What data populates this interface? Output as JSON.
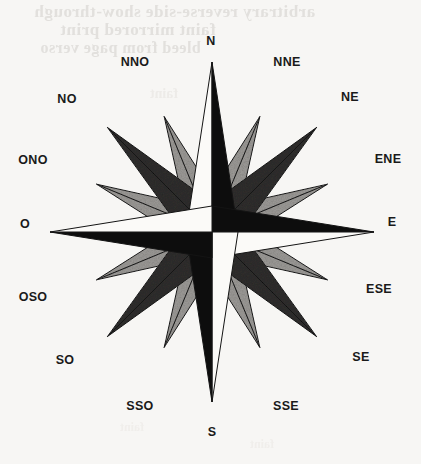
{
  "image": {
    "kind": "compass-rose-drawing",
    "medium": "pencil and ink on paper",
    "background_color": "#f7f6f4",
    "width": 421,
    "height": 464
  },
  "bleed_through_text": {
    "line1": "arbitrary reverse-side show-through",
    "line2": "faint mirrored print",
    "line3": "bleed from page verso",
    "line4": "faint",
    "line5": "faint",
    "line6": "faint",
    "line7": "faint"
  },
  "compass": {
    "center": {
      "x": 212,
      "y": 232
    },
    "colors": {
      "dark": "#0d0d0d",
      "light": "#fbfaf8",
      "charcoal": "#2f2e2d",
      "gray": "#9d9b98",
      "outline": "#141414"
    },
    "labels": [
      {
        "name": "N",
        "text": "N",
        "x": 211,
        "y": 41,
        "bearing": 0
      },
      {
        "name": "NNE",
        "text": "NNE",
        "x": 287,
        "y": 62,
        "bearing": 22.5
      },
      {
        "name": "NE",
        "text": "NE",
        "x": 350,
        "y": 97,
        "bearing": 45
      },
      {
        "name": "ENE",
        "text": "ENE",
        "x": 388,
        "y": 159,
        "bearing": 67.5
      },
      {
        "name": "E",
        "text": "E",
        "x": 392,
        "y": 222,
        "bearing": 90
      },
      {
        "name": "ESE",
        "text": "ESE",
        "x": 379,
        "y": 289,
        "bearing": 112.5
      },
      {
        "name": "SE",
        "text": "SE",
        "x": 361,
        "y": 357,
        "bearing": 135
      },
      {
        "name": "SSE",
        "text": "SSE",
        "x": 286,
        "y": 406,
        "bearing": 157.5
      },
      {
        "name": "S",
        "text": "S",
        "x": 212,
        "y": 432,
        "bearing": 180
      },
      {
        "name": "SSO",
        "text": "SSO",
        "x": 140,
        "y": 406,
        "bearing": 202.5
      },
      {
        "name": "SO",
        "text": "SO",
        "x": 65,
        "y": 360,
        "bearing": 225
      },
      {
        "name": "OSO",
        "text": "OSO",
        "x": 33,
        "y": 297,
        "bearing": 247.5
      },
      {
        "name": "O",
        "text": "O",
        "x": 25,
        "y": 224,
        "bearing": 270
      },
      {
        "name": "ONO",
        "text": "ONO",
        "x": 33,
        "y": 160,
        "bearing": 292.5
      },
      {
        "name": "NO",
        "text": "NO",
        "x": 67,
        "y": 99,
        "bearing": 315
      },
      {
        "name": "NNO",
        "text": "NNO",
        "x": 135,
        "y": 62,
        "bearing": 337.5
      }
    ],
    "points": [
      {
        "name": "N",
        "class": "cardinal",
        "bearing": 0,
        "radius": 170,
        "half_width": 26,
        "fill_ccw": "light",
        "fill_cw": "dark"
      },
      {
        "name": "NNE",
        "class": "secondary",
        "bearing": 22.5,
        "radius": 125,
        "half_width": 22,
        "fill_ccw": "gray",
        "fill_cw": "gray"
      },
      {
        "name": "NE",
        "class": "intercardinal",
        "bearing": 45,
        "radius": 148,
        "half_width": 24,
        "fill_ccw": "charcoal",
        "fill_cw": "charcoal"
      },
      {
        "name": "ENE",
        "class": "secondary",
        "bearing": 67.5,
        "radius": 125,
        "half_width": 22,
        "fill_ccw": "gray",
        "fill_cw": "gray"
      },
      {
        "name": "E",
        "class": "cardinal",
        "bearing": 90,
        "radius": 162,
        "half_width": 26,
        "fill_ccw": "dark",
        "fill_cw": "light"
      },
      {
        "name": "ESE",
        "class": "secondary",
        "bearing": 112.5,
        "radius": 125,
        "half_width": 22,
        "fill_ccw": "gray",
        "fill_cw": "gray"
      },
      {
        "name": "SE",
        "class": "intercardinal",
        "bearing": 135,
        "radius": 148,
        "half_width": 24,
        "fill_ccw": "charcoal",
        "fill_cw": "charcoal"
      },
      {
        "name": "SSE",
        "class": "secondary",
        "bearing": 157.5,
        "radius": 125,
        "half_width": 22,
        "fill_ccw": "gray",
        "fill_cw": "gray"
      },
      {
        "name": "S",
        "class": "cardinal",
        "bearing": 180,
        "radius": 170,
        "half_width": 26,
        "fill_ccw": "light",
        "fill_cw": "dark"
      },
      {
        "name": "SSO",
        "class": "secondary",
        "bearing": 202.5,
        "radius": 125,
        "half_width": 22,
        "fill_ccw": "gray",
        "fill_cw": "gray"
      },
      {
        "name": "SO",
        "class": "intercardinal",
        "bearing": 225,
        "radius": 148,
        "half_width": 24,
        "fill_ccw": "charcoal",
        "fill_cw": "charcoal"
      },
      {
        "name": "OSO",
        "class": "secondary",
        "bearing": 247.5,
        "radius": 125,
        "half_width": 22,
        "fill_ccw": "gray",
        "fill_cw": "gray"
      },
      {
        "name": "O",
        "class": "cardinal",
        "bearing": 270,
        "radius": 162,
        "half_width": 26,
        "fill_ccw": "dark",
        "fill_cw": "light"
      },
      {
        "name": "ONO",
        "class": "secondary",
        "bearing": 292.5,
        "radius": 125,
        "half_width": 22,
        "fill_ccw": "gray",
        "fill_cw": "gray"
      },
      {
        "name": "NO",
        "class": "intercardinal",
        "bearing": 315,
        "radius": 148,
        "half_width": 24,
        "fill_ccw": "charcoal",
        "fill_cw": "charcoal"
      },
      {
        "name": "NNO",
        "class": "secondary",
        "bearing": 337.5,
        "radius": 125,
        "half_width": 22,
        "fill_ccw": "gray",
        "fill_cw": "gray"
      }
    ]
  }
}
